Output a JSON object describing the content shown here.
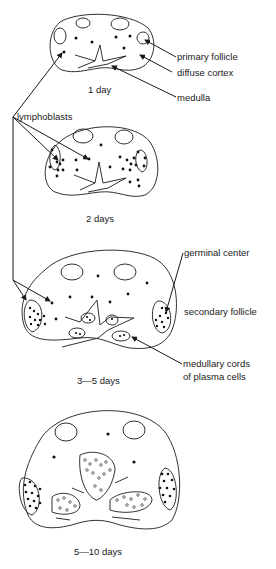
{
  "diagram": {
    "stages": [
      {
        "id": "stage-1",
        "caption": "1 day"
      },
      {
        "id": "stage-2",
        "caption": "2 days"
      },
      {
        "id": "stage-3",
        "caption": "3—5 days"
      },
      {
        "id": "stage-4",
        "caption": "5—10 days"
      }
    ],
    "labels": {
      "primary_follicle": "primary follicle",
      "diffuse_cortex": "diffuse cortex",
      "medulla": "medulla",
      "lymphoblasts": "lymphoblasts",
      "germinal_center": "germinal center",
      "secondary_follicle": "secondary follicle",
      "medullary_cords_line1": "medullary cords",
      "medullary_cords_line2": "of plasma cells"
    },
    "colors": {
      "ink": "#1a1a1a",
      "background": "#ffffff"
    }
  }
}
